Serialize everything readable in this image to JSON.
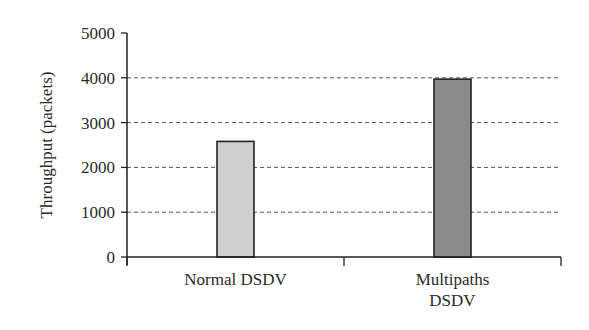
{
  "chart_data": {
    "type": "bar",
    "title": "",
    "xlabel": "",
    "ylabel": "Throughput (packets)",
    "categories": [
      "Normal DSDV",
      "Multipaths DSDV"
    ],
    "category_label_lines": [
      [
        "Normal DSDV"
      ],
      [
        "Multipaths",
        "DSDV"
      ]
    ],
    "values": [
      2580,
      3970
    ],
    "bar_colors": [
      "#cfcfcf",
      "#8a8a8a"
    ],
    "ylim": [
      0,
      5000
    ],
    "yticks": [
      0,
      1000,
      2000,
      3000,
      4000,
      5000
    ],
    "ytick_labels": [
      "0",
      "1000",
      "2000",
      "3000",
      "4000",
      "5000"
    ],
    "grid": {
      "y": true,
      "style": "dashed"
    },
    "legend": null
  }
}
